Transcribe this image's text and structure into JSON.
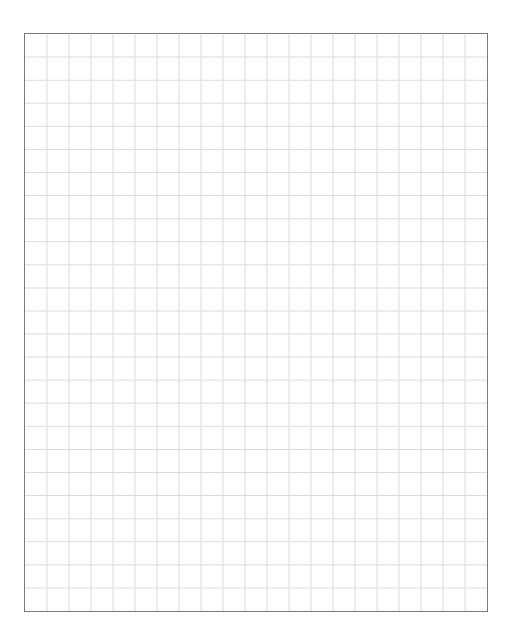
{
  "grid": {
    "columns": 21,
    "rows": 25,
    "border_color": "#7a7a7a",
    "line_color": "#dcdcdc",
    "background": "#ffffff"
  }
}
